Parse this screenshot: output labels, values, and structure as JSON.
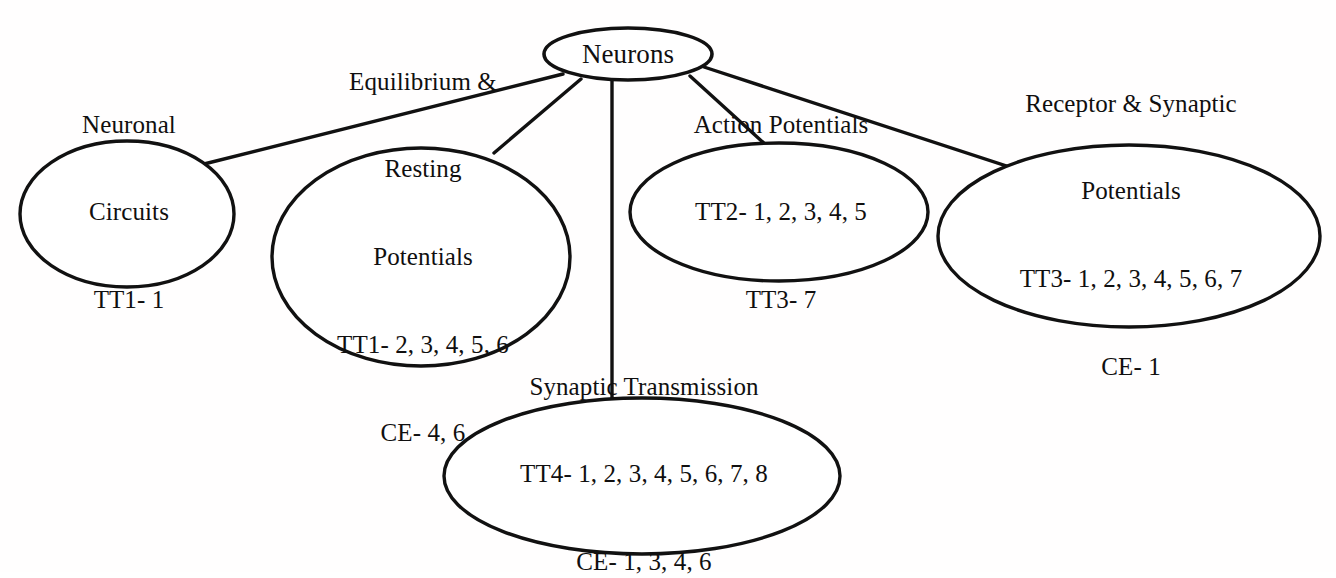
{
  "diagram": {
    "type": "concept-map",
    "title": "Neurons",
    "background_color": "#ffffff",
    "stroke_color": "#111111",
    "root": {
      "id": "neurons",
      "label": "Neurons",
      "lines": [
        "Neurons"
      ]
    },
    "nodes": [
      {
        "id": "neuronal-circuits",
        "label": "Neuronal Circuits",
        "lines": [
          "Neuronal",
          "Circuits",
          "TT1- 1"
        ],
        "references": [
          "TT1- 1"
        ]
      },
      {
        "id": "equilibrium-resting-potentials",
        "label": "Equilibrium & Resting Potentials",
        "lines": [
          "Equilibrium &",
          "Resting",
          "Potentials",
          "TT1- 2, 3, 4, 5, 6",
          "CE- 4, 6"
        ],
        "references": [
          "TT1- 2, 3, 4, 5, 6",
          "CE- 4, 6"
        ]
      },
      {
        "id": "action-potentials",
        "label": "Action Potentials",
        "lines": [
          "Action Potentials",
          "TT2- 1, 2, 3, 4, 5",
          "TT3- 7"
        ],
        "references": [
          "TT2- 1, 2, 3, 4, 5",
          "TT3- 7"
        ]
      },
      {
        "id": "receptor-synaptic-potentials",
        "label": "Receptor & Synaptic Potentials",
        "lines": [
          "Receptor & Synaptic",
          "Potentials",
          "TT3- 1, 2, 3, 4, 5, 6, 7",
          "CE- 1"
        ],
        "references": [
          "TT3- 1, 2, 3, 4, 5, 6, 7",
          "CE- 1"
        ]
      },
      {
        "id": "synaptic-transmission",
        "label": "Synaptic Transmission",
        "lines": [
          "Synaptic Transmission",
          "TT4- 1, 2, 3, 4, 5, 6, 7, 8",
          "CE- 1, 3, 4, 6"
        ],
        "references": [
          "TT4- 1, 2, 3, 4, 5, 6, 7, 8",
          "CE- 1, 3, 4, 6"
        ]
      }
    ],
    "edges": [
      {
        "from": "neurons",
        "to": "neuronal-circuits"
      },
      {
        "from": "neurons",
        "to": "equilibrium-resting-potentials"
      },
      {
        "from": "neurons",
        "to": "action-potentials"
      },
      {
        "from": "neurons",
        "to": "receptor-synaptic-potentials"
      },
      {
        "from": "neurons",
        "to": "synaptic-transmission"
      }
    ]
  }
}
